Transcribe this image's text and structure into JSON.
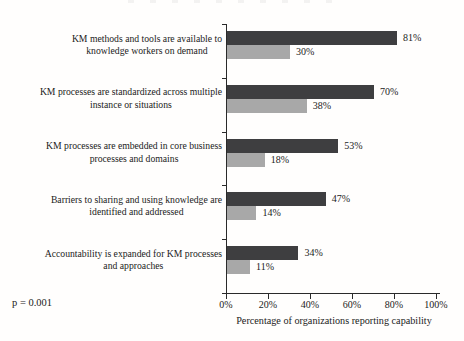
{
  "figure": {
    "colors": {
      "dark_bar": "#3e3e40",
      "light_bar": "#a8a8a8",
      "axis": "#2a2a2a",
      "text": "#1b1b1b"
    }
  },
  "chart_data": {
    "type": "bar",
    "orientation": "horizontal",
    "title": "",
    "xlabel": "Percentage of organizations reporting capability",
    "ylabel": "",
    "xlim": [
      0,
      100
    ],
    "grid": false,
    "legend_position": "none",
    "x_tick_values": [
      0,
      20,
      40,
      60,
      80,
      100
    ],
    "x_tick_labels": [
      "0%",
      "20%",
      "40%",
      "60%",
      "80%",
      "100%"
    ],
    "categories": [
      "KM methods and tools are available to\nknowledge workers on demand",
      "KM processes are standardized across multiple\ninstance or situations",
      "KM processes are embedded in core business\nprocesses and domains",
      "Barriers to sharing and using knowledge are\nidentified and addressed",
      "Accountability is expanded for KM processes\nand approaches"
    ],
    "series": [
      {
        "name": "dark-series",
        "color_key": "dark_bar",
        "values": [
          81,
          70,
          53,
          47,
          34
        ],
        "labels": [
          "81%",
          "70%",
          "53%",
          "47%",
          "34%"
        ]
      },
      {
        "name": "light-series",
        "color_key": "light_bar",
        "values": [
          30,
          38,
          18,
          14,
          11
        ],
        "labels": [
          "30%",
          "38%",
          "18%",
          "14%",
          "11%"
        ]
      }
    ],
    "annotation": "p = 0.001"
  }
}
